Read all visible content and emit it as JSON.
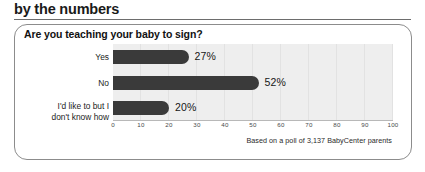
{
  "heading": "by the numbers",
  "card": {
    "title": "Are you teaching your baby to sign?",
    "source_note": "Based on a poll of 3,137 BabyCenter parents"
  },
  "chart_data": {
    "type": "bar",
    "orientation": "horizontal",
    "title": "Are you teaching your baby to sign?",
    "xlabel": "",
    "ylabel": "",
    "categories": [
      "Yes",
      "No",
      "I'd like to but I\ndon't know how"
    ],
    "values": [
      27,
      52,
      20
    ],
    "value_labels": [
      "27%",
      "52%",
      "20%"
    ],
    "xlim": [
      0,
      100
    ],
    "xticks": [
      0,
      10,
      20,
      30,
      40,
      50,
      60,
      70,
      80,
      90,
      100
    ],
    "xtick_labels": [
      "0",
      "10",
      "20",
      "30",
      "40",
      "50",
      "60",
      "70",
      "80",
      "90",
      "100"
    ],
    "grid": true,
    "legend": false,
    "bar_color": "#3a3a3a",
    "plot_background": "#eeeeee",
    "annotation": "Based on a poll of 3,137 BabyCenter parents"
  }
}
